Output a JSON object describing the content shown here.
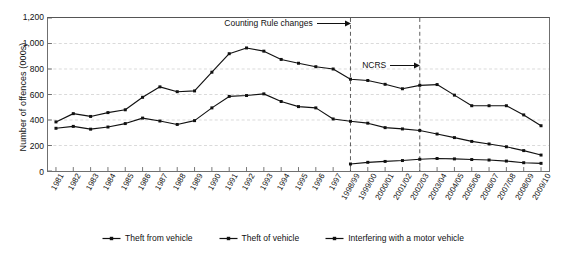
{
  "chart_data": {
    "type": "line",
    "title": "",
    "xlabel": "",
    "ylabel": "Number of offences (000s)",
    "ylim": [
      0,
      1200
    ],
    "yticks": [
      "0",
      "200",
      "400",
      "600",
      "800",
      "1,000",
      "1,200"
    ],
    "ytick_values": [
      0,
      200,
      400,
      600,
      800,
      1000,
      1200
    ],
    "grid": "horizontal-dashed",
    "legend_position": "bottom-center",
    "categories": [
      "1981",
      "1982",
      "1983",
      "1984",
      "1985",
      "1986",
      "1987",
      "1988",
      "1989",
      "1990",
      "1991",
      "1992",
      "1993",
      "1994",
      "1995",
      "1996",
      "1997",
      "1998/99",
      "1999/00",
      "2000/01",
      "2001/02",
      "2002/03",
      "2003/04",
      "2004/05",
      "2005/06",
      "2006/07",
      "2007/08",
      "2008/09",
      "2009/10"
    ],
    "series": [
      {
        "name": "Theft from vehicle",
        "marker": "square",
        "color": "#111111",
        "values": [
          385,
          450,
          428,
          458,
          480,
          578,
          660,
          622,
          628,
          775,
          920,
          965,
          940,
          875,
          845,
          818,
          800,
          720,
          710,
          680,
          645,
          672,
          678,
          595,
          512,
          512,
          512,
          440,
          355
        ]
      },
      {
        "name": "Theft of vehicle",
        "marker": "square",
        "color": "#111111",
        "values": [
          335,
          350,
          328,
          345,
          372,
          415,
          392,
          365,
          395,
          495,
          585,
          592,
          605,
          545,
          505,
          495,
          408,
          390,
          375,
          340,
          330,
          318,
          290,
          262,
          232,
          212,
          190,
          160,
          125
        ]
      },
      {
        "name": "Interfering with a motor vehicle",
        "marker": "square",
        "color": "#111111",
        "values": [
          null,
          null,
          null,
          null,
          null,
          null,
          null,
          null,
          null,
          null,
          null,
          null,
          null,
          null,
          null,
          null,
          null,
          55,
          68,
          75,
          82,
          92,
          98,
          95,
          90,
          86,
          78,
          65,
          60
        ]
      }
    ],
    "annotations": [
      {
        "text": "Counting Rule changes",
        "target_category": "1998/99"
      },
      {
        "text": "NCRS",
        "target_category": "2002/03"
      }
    ],
    "vlines": [
      {
        "category": "1998/99",
        "style": "dashed"
      },
      {
        "category": "2002/03",
        "style": "dashed"
      }
    ]
  }
}
